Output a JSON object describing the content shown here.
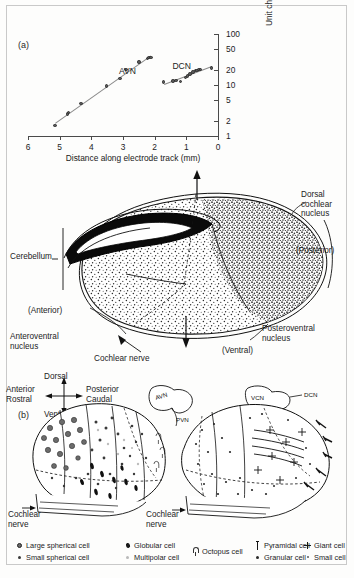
{
  "figure": {
    "panel_a_id": "(a)",
    "panel_b_id": "(b)"
  },
  "chart_data": {
    "type": "scatter",
    "title": "",
    "xlabel": "Distance along electrode track (mm)",
    "ylabel": "Unit characteristic frequency (kHz)",
    "x_ticks": [
      "6",
      "5",
      "4",
      "3",
      "2",
      "1",
      "0"
    ],
    "x_tick_values": [
      6,
      5,
      4,
      3,
      2,
      1,
      0
    ],
    "xlim": [
      6,
      0
    ],
    "x_axis_reversed": true,
    "y_ticks": [
      "1",
      "2",
      "5",
      "10",
      "20",
      "50",
      "100"
    ],
    "y_tick_values": [
      1,
      2,
      5,
      10,
      20,
      50,
      100
    ],
    "ylim": [
      1,
      100
    ],
    "y_scale": "log",
    "y_axis_position": "right",
    "grid": false,
    "legend_position": "inline-annotation",
    "series": [
      {
        "name": "AVN",
        "annotation": "AVN",
        "points": [
          {
            "x": 5.15,
            "y": 1.6
          },
          {
            "x": 4.75,
            "y": 2.7
          },
          {
            "x": 4.72,
            "y": 2.9
          },
          {
            "x": 4.33,
            "y": 4.3
          },
          {
            "x": 3.52,
            "y": 9.5
          },
          {
            "x": 3.1,
            "y": 13.5
          },
          {
            "x": 2.9,
            "y": 20.0
          },
          {
            "x": 2.5,
            "y": 28.0
          },
          {
            "x": 2.22,
            "y": 33.0
          },
          {
            "x": 2.18,
            "y": 34.5
          },
          {
            "x": 2.12,
            "y": 35.0
          }
        ]
      },
      {
        "name": "DCN",
        "annotation": "DCN",
        "points": [
          {
            "x": 1.72,
            "y": 11.5
          },
          {
            "x": 1.42,
            "y": 12.0
          },
          {
            "x": 1.33,
            "y": 12.2
          },
          {
            "x": 1.19,
            "y": 11.8
          },
          {
            "x": 1.02,
            "y": 14.0
          },
          {
            "x": 0.96,
            "y": 15.0
          },
          {
            "x": 0.89,
            "y": 16.5
          },
          {
            "x": 0.79,
            "y": 18.0
          },
          {
            "x": 0.72,
            "y": 19.0
          },
          {
            "x": 0.66,
            "y": 19.5
          },
          {
            "x": 0.6,
            "y": 20.0
          },
          {
            "x": 0.55,
            "y": 20.2
          },
          {
            "x": 0.2,
            "y": 21.5
          }
        ]
      }
    ]
  },
  "middle_diagram": {
    "name": "cochlear-nucleus-section",
    "labels": {
      "cerebellum": "Cerebellum",
      "dorsal_cochlear_nucleus": "Dorsal\ncochlear\nnucleus",
      "posterior": "(Posterior)",
      "anterior": "(Anterior)",
      "ventral": "(Ventral)",
      "anteroventral_nucleus": "Anteroventral\nnucleus",
      "posteroventral_nucleus": "Posteroventral\nnucleus",
      "cochlear_nerve": "Cochlear nerve"
    }
  },
  "compass": {
    "dorsal": "Dorsal",
    "ventral": "Ventral",
    "anterior": "Anterior",
    "rostral": "Rostral",
    "posterior": "Posterior",
    "caudal": "Caudal"
  },
  "panel_b": {
    "left": {
      "inset_labels": {
        "avn": "AVN",
        "pvn": "PVN"
      },
      "cochlear_nerve": "Cochlear\nnerve"
    },
    "right": {
      "inset_labels": {
        "vcn": "VCN",
        "dcn": "DCN"
      },
      "cochlear_nerve": "Cochlear\nnerve"
    }
  },
  "legend": {
    "columns": [
      {
        "items": [
          {
            "glyph": "large-filled-circle-icon",
            "label": "Large spherical cell"
          },
          {
            "glyph": "small-filled-circle-icon",
            "label": "Small spherical cell"
          }
        ]
      },
      {
        "items": [
          {
            "glyph": "globular-cell-icon",
            "label": "Globular cell"
          },
          {
            "glyph": "multipolar-cell-icon",
            "label": "Multipolar cell"
          }
        ]
      },
      {
        "items": [
          {
            "glyph": "octopus-cell-icon",
            "label": "Octopus cell"
          }
        ]
      },
      {
        "items": [
          {
            "glyph": "pyramidal-cell-icon",
            "label": "Pyramidal cell"
          },
          {
            "glyph": "granular-cell-icon",
            "label": "Granular cell"
          }
        ]
      },
      {
        "items": [
          {
            "glyph": "giant-cell-icon",
            "label": "Giant cell"
          },
          {
            "glyph": "small-cell-icon",
            "label": "Small cell"
          }
        ]
      }
    ]
  },
  "colors": {
    "frame": "#c9c9c9",
    "axis": "#4a4a4a",
    "point": "#5a5a5a",
    "ink": "#1c1c1c"
  }
}
